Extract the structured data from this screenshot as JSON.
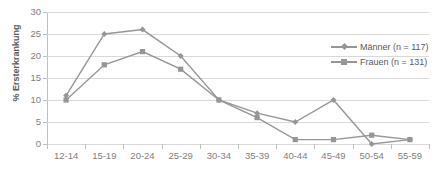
{
  "chart_data": {
    "type": "line",
    "title": "",
    "subtitle": "",
    "xlabel": "",
    "ylabel": "% Ersterkrankung",
    "categories": [
      "12-14",
      "15-19",
      "20-24",
      "25-29",
      "30-34",
      "35-39",
      "40-44",
      "45-49",
      "50-54",
      "55-59"
    ],
    "ylim": [
      0,
      30
    ],
    "yticks": [
      0,
      5,
      10,
      15,
      20,
      25,
      30
    ],
    "ytick_labels": [
      "0",
      "5",
      "10",
      "15",
      "20",
      "25",
      "30"
    ],
    "grid": true,
    "legend_position": "upper-right",
    "series": [
      {
        "name": "Männer (n = 117)",
        "marker": "diamond",
        "color": "#969696",
        "values": [
          11,
          25,
          26,
          20,
          10,
          7,
          5,
          10,
          0,
          1
        ]
      },
      {
        "name": "Frauen (n = 131)",
        "marker": "square",
        "color": "#969696",
        "values": [
          10,
          18,
          21,
          17,
          10,
          6,
          1,
          1,
          2,
          1
        ]
      }
    ]
  },
  "legend": {
    "entries": [
      {
        "label": "Männer (n = 117)"
      },
      {
        "label": "Frauen (n = 131)"
      }
    ]
  },
  "colors": {
    "series_line": "#969696",
    "gridline": "#d9d9d9",
    "axis": "#bfbfbf",
    "tick_text": "#808080",
    "axis_title_text": "#595959",
    "background": "#ffffff"
  }
}
